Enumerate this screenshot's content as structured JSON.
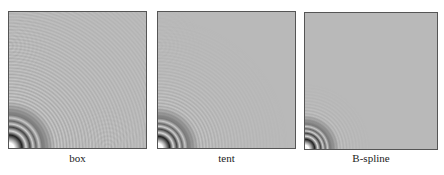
{
  "figure": {
    "panels": [
      {
        "id": "box",
        "label": "box",
        "aliasing": "strong"
      },
      {
        "id": "tent",
        "label": "tent",
        "aliasing": "moderate"
      },
      {
        "id": "bspline",
        "label": "B-spline",
        "aliasing": "weak"
      }
    ],
    "colors": {
      "background": "#b9b9b9",
      "border": "#555555"
    }
  }
}
